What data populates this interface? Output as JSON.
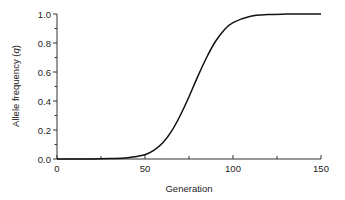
{
  "chart_data": {
    "type": "line",
    "title": "",
    "xlabel": "Generation",
    "ylabel": "Allele frequency (q)",
    "ylabel_parts": {
      "text": "Allele frequency (",
      "var": "q",
      "close": ")"
    },
    "xlim": [
      0,
      150
    ],
    "ylim": [
      0.0,
      1.0
    ],
    "x_ticks": [
      0,
      50,
      100,
      150
    ],
    "x_tick_labels": [
      "0",
      "50",
      "100",
      "150"
    ],
    "x_minor_ticks": [
      25,
      75,
      125
    ],
    "y_ticks": [
      0.0,
      0.2,
      0.4,
      0.6,
      0.8,
      1.0
    ],
    "y_tick_labels": [
      "0.0",
      "0.2",
      "0.4",
      "0.6",
      "0.8",
      "1.0"
    ],
    "y_minor_ticks": [
      0.1,
      0.3,
      0.5,
      0.7,
      0.9
    ],
    "grid": false,
    "legend": null,
    "series": [
      {
        "name": "q",
        "color": "#111111",
        "x": [
          0,
          10,
          20,
          30,
          40,
          50,
          55,
          60,
          65,
          70,
          75,
          80,
          85,
          90,
          95,
          100,
          110,
          120,
          130,
          140,
          150
        ],
        "values": [
          0.0001,
          0.0003,
          0.001,
          0.003,
          0.008,
          0.03,
          0.06,
          0.11,
          0.19,
          0.3,
          0.43,
          0.57,
          0.7,
          0.81,
          0.89,
          0.94,
          0.985,
          0.996,
          0.999,
          1.0,
          1.0
        ]
      }
    ]
  }
}
